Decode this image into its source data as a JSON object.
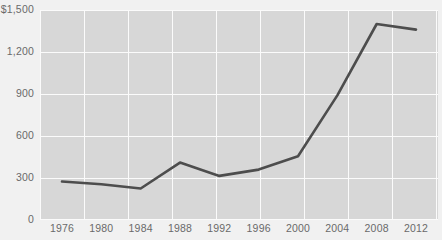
{
  "chart_data": {
    "type": "line",
    "title": "",
    "subtitle": "",
    "xlabel": "",
    "ylabel": "",
    "x": [
      1976,
      1980,
      1984,
      1988,
      1992,
      1996,
      2000,
      2004,
      2008,
      2012
    ],
    "categories": [
      "1976",
      "1980",
      "1984",
      "1988",
      "1992",
      "1996",
      "2000",
      "2004",
      "2008",
      "2012"
    ],
    "values": [
      275,
      255,
      225,
      410,
      315,
      360,
      455,
      890,
      1400,
      1360
    ],
    "series": [
      {
        "name": "",
        "values": [
          275,
          255,
          225,
          410,
          315,
          360,
          455,
          890,
          1400,
          1360
        ]
      }
    ],
    "ylim": [
      0,
      1500
    ],
    "xlim": [
      1974,
      2014
    ],
    "ytick_values": [
      0,
      300,
      600,
      900,
      1200,
      1500
    ],
    "ytick_labels": [
      "0",
      "300",
      "600",
      "900",
      "1,200",
      "$1,500"
    ],
    "xtick_labels": [
      "1976",
      "1980",
      "1984",
      "1988",
      "1992",
      "1996",
      "2000",
      "2004",
      "2008",
      "2012"
    ],
    "grid": true,
    "grid_color": "#fbfbfb",
    "legend": false,
    "legend_position": "none",
    "annotations": [],
    "line_color": "#4d4d4d",
    "plot_background": "#d7d7d7",
    "page_background": "#f1f1f1",
    "tick_label_color": "#6a6a6a"
  }
}
